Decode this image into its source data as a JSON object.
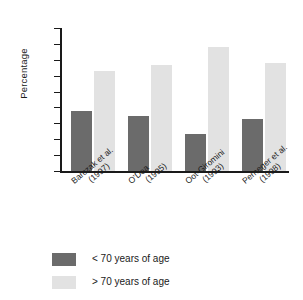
{
  "chart_data": {
    "type": "bar",
    "title": "",
    "xlabel": "",
    "ylabel": "Percentage",
    "ylim": [
      0,
      90
    ],
    "ytick_step": 10,
    "yticks": [
      90,
      80,
      70,
      60,
      50,
      40,
      30,
      20,
      10,
      0
    ],
    "grid": false,
    "legend_position": "bottom-left",
    "categories": [
      "Barczak et al. (1997)",
      "O'Dea (1995)",
      "Oot-Giromini (1993)",
      "Perneger et al. (1998)"
    ],
    "category_lines": [
      [
        "Barczak et al.",
        "(1997)"
      ],
      [
        "O'Dea",
        "(1995)"
      ],
      [
        "Oot-Giromini",
        "(1993)"
      ],
      [
        "Perneger et al.",
        "(1998)"
      ]
    ],
    "series": [
      {
        "name": "< 70 years of age",
        "color": "#6b6b6b",
        "values": [
          37.5,
          34.5,
          23.5,
          33
        ]
      },
      {
        "name": "> 70 years of age",
        "color": "#e2e2e2",
        "values": [
          63,
          67,
          78,
          68
        ]
      }
    ]
  },
  "legend": {
    "items": [
      {
        "label": "< 70 years of age",
        "swatch": "low"
      },
      {
        "label": "> 70 years of age",
        "swatch": "high"
      }
    ]
  }
}
